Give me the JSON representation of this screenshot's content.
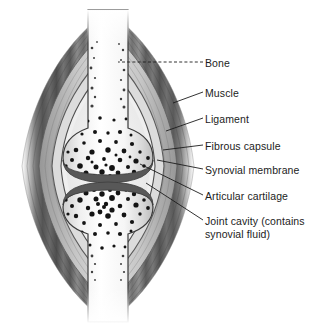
{
  "figure": {
    "background_color": "#ffffff",
    "text_color": "#1c1c1c",
    "palette": {
      "muscle_dark": "#4a4a4a",
      "muscle_mid": "#6e6e6e",
      "muscle_light": "#a8a8a8",
      "capsule_band": "#8f8f8f",
      "cartilage": "#585858",
      "bone_outline": "#3a3a3a",
      "bone_fill": "#f4f4f4",
      "trabecula": "#141414",
      "cavity": "#ededed",
      "leader_line": "#1c1c1c"
    }
  },
  "labels": [
    {
      "id": "bone",
      "text": "Bone",
      "x": 205,
      "y": 57,
      "leader": {
        "style": "dashed",
        "x1": 203,
        "y1": 62,
        "x2": 118,
        "y2": 62
      }
    },
    {
      "id": "muscle",
      "text": "Muscle",
      "x": 205,
      "y": 87,
      "leader": {
        "style": "solid",
        "x1": 203,
        "y1": 92,
        "x2": 173,
        "y2": 103
      }
    },
    {
      "id": "ligament",
      "text": "Ligament",
      "x": 205,
      "y": 113,
      "leader": {
        "style": "solid",
        "x1": 203,
        "y1": 118,
        "x2": 166,
        "y2": 131
      }
    },
    {
      "id": "fibrous-capsule",
      "text": "Fibrous capsule",
      "x": 205,
      "y": 140,
      "leader": {
        "style": "solid",
        "x1": 203,
        "y1": 145,
        "x2": 163,
        "y2": 150
      }
    },
    {
      "id": "synovial-membrane",
      "text": "Synovial membrane",
      "x": 205,
      "y": 164,
      "leader": {
        "style": "solid",
        "x1": 203,
        "y1": 169,
        "x2": 157,
        "y2": 160
      }
    },
    {
      "id": "articular-cartilage",
      "text": "Articular cartilage",
      "x": 205,
      "y": 190,
      "leader": {
        "style": "solid",
        "x1": 203,
        "y1": 195,
        "x2": 140,
        "y2": 164
      }
    },
    {
      "id": "joint-cavity",
      "text": "Joint cavity (contains",
      "text_line2": "synovial fluid)",
      "x": 205,
      "y": 215,
      "leader": {
        "style": "solid",
        "x1": 203,
        "y1": 220,
        "x2": 146,
        "y2": 183
      }
    }
  ],
  "structures": [
    {
      "id": "upper-bone-shaft",
      "name": "Upper bone diaphysis"
    },
    {
      "id": "upper-bone-epiphysis",
      "name": "Upper bone epiphysis"
    },
    {
      "id": "lower-bone-epiphysis",
      "name": "Lower bone epiphysis"
    },
    {
      "id": "lower-bone-shaft",
      "name": "Lower bone diaphysis"
    },
    {
      "id": "muscle-mass",
      "name": "Muscle"
    },
    {
      "id": "ligament-band",
      "name": "Ligament"
    },
    {
      "id": "fibrous-capsule-band",
      "name": "Fibrous capsule"
    },
    {
      "id": "synovial-membrane-band",
      "name": "Synovial membrane"
    },
    {
      "id": "articular-cartilage-upper",
      "name": "Upper articular cartilage"
    },
    {
      "id": "articular-cartilage-lower",
      "name": "Lower articular cartilage"
    },
    {
      "id": "joint-cavity-space",
      "name": "Joint cavity"
    }
  ]
}
